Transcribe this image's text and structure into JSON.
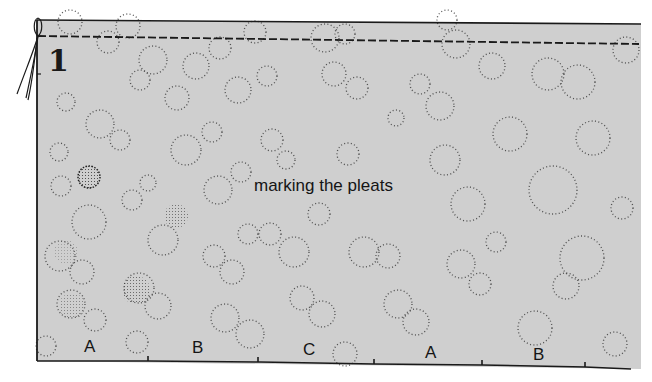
{
  "figure": {
    "number": "1",
    "caption": "marking the pleats"
  },
  "colors": {
    "fabric": "#cfcfcf",
    "ink": "#1a1a1a",
    "background": "#ffffff"
  },
  "pleat_markers": {
    "labels": [
      {
        "text": "A",
        "x": 84,
        "y": 340
      },
      {
        "text": "B",
        "x": 192,
        "y": 341
      },
      {
        "text": "C",
        "x": 303,
        "y": 343
      },
      {
        "text": "A",
        "x": 425,
        "y": 346
      },
      {
        "text": "B",
        "x": 533,
        "y": 348
      }
    ],
    "tick_x": [
      148,
      258,
      374,
      482,
      585
    ]
  },
  "elements": {
    "stitch_line": "dashed basting line",
    "thread_ends": "loose thread ends",
    "pattern": "polka-dot fabric"
  }
}
